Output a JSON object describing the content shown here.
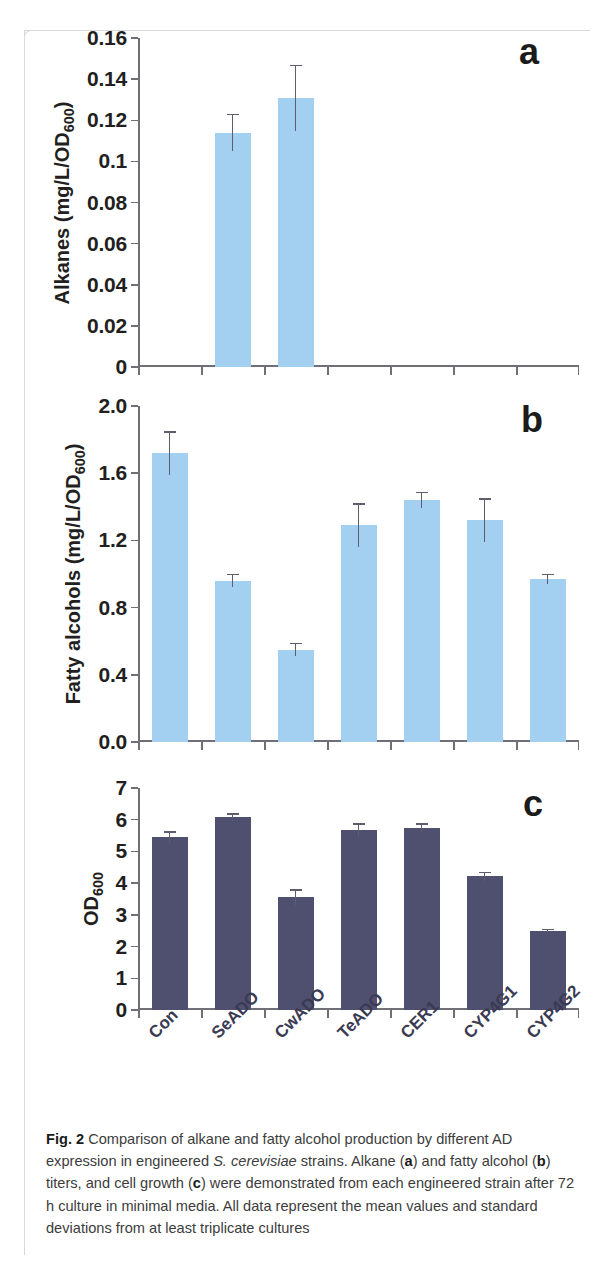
{
  "figure": {
    "label": "Fig. 2",
    "caption_parts": {
      "p1": "Comparison of alkane and fatty alcohol production by different AD expression in engineered ",
      "species": "S. cerevisiae",
      "p2": " strains. Alkane (",
      "a": "a",
      "p3": ") and fatty alcohol (",
      "b": "b",
      "p4": ") titers, and cell growth (",
      "c": "c",
      "p5": ") were demonstrated from each engineered strain after 72 h culture in minimal media. All data represent the mean values and standard deviations from at least triplicate cultures"
    }
  },
  "colors": {
    "light_bar": "#a3cff0",
    "dark_bar": "#4f4f70",
    "axis": "#6f6f77",
    "text": "#231f20",
    "category_label": "#3a3a52"
  },
  "categories": [
    "Con",
    "SeADO",
    "CwADO",
    "TeADO",
    "CER1",
    "CYP4G1",
    "CYP4G2"
  ],
  "chart_data": [
    {
      "type": "bar",
      "panel": "a",
      "title": "",
      "xlabel": "",
      "ylabel": "Alkanes (mg/L/OD600)",
      "ylabel_main": "Alkanes (mg/L/OD",
      "ylabel_sub": "600",
      "ylabel_tail": ")",
      "categories": [
        "Con",
        "SeADO",
        "CwADO",
        "TeADO",
        "CER1",
        "CYP4G1",
        "CYP4G2"
      ],
      "values": [
        0,
        0.114,
        0.131,
        0,
        0,
        0,
        0
      ],
      "errors": [
        0,
        0.009,
        0.016,
        0,
        0,
        0,
        0
      ],
      "ylim": [
        0,
        0.16
      ],
      "ytick_values": [
        0,
        0.02,
        0.04,
        0.06,
        0.08,
        0.1,
        0.12,
        0.14,
        0.16
      ],
      "ytick_labels": [
        "0",
        "0.02",
        "0.04",
        "0.06",
        "0.08",
        "0.1",
        "0.12",
        "0.14",
        "0.16"
      ],
      "grid": false,
      "legend": "none",
      "bar_color": "#a3cff0"
    },
    {
      "type": "bar",
      "panel": "b",
      "title": "",
      "xlabel": "",
      "ylabel": "Fatty alcohols (mg/L/OD600)",
      "ylabel_main": "Fatty alcohols (mg/L/OD",
      "ylabel_sub": "600",
      "ylabel_tail": ")",
      "categories": [
        "Con",
        "SeADO",
        "CwADO",
        "TeADO",
        "CER1",
        "CYP4G1",
        "CYP4G2"
      ],
      "values": [
        1.72,
        0.96,
        0.55,
        1.29,
        1.44,
        1.32,
        0.97
      ],
      "errors": [
        0.13,
        0.04,
        0.04,
        0.13,
        0.05,
        0.13,
        0.03
      ],
      "ylim": [
        0,
        2.0
      ],
      "ytick_values": [
        0.0,
        0.4,
        0.8,
        1.2,
        1.6,
        2.0
      ],
      "ytick_labels": [
        "0.0",
        "0.4",
        "0.8",
        "1.2",
        "1.6",
        "2.0"
      ],
      "grid": false,
      "legend": "none",
      "bar_color": "#a3cff0"
    },
    {
      "type": "bar",
      "panel": "c",
      "title": "",
      "xlabel": "",
      "ylabel": "OD600",
      "ylabel_main": "OD",
      "ylabel_sub": "600",
      "ylabel_tail": "",
      "categories": [
        "Con",
        "SeADO",
        "CwADO",
        "TeADO",
        "CER1",
        "CYP4G1",
        "CYP4G2"
      ],
      "values": [
        5.45,
        6.1,
        3.55,
        5.69,
        5.75,
        4.22,
        2.5
      ],
      "errors": [
        0.18,
        0.1,
        0.25,
        0.2,
        0.14,
        0.14,
        0.06
      ],
      "ylim": [
        0,
        7
      ],
      "ytick_values": [
        0,
        1,
        2,
        3,
        4,
        5,
        6,
        7
      ],
      "ytick_labels": [
        "0",
        "1",
        "2",
        "3",
        "4",
        "5",
        "6",
        "7"
      ],
      "grid": false,
      "legend": "none",
      "bar_color": "#4f4f70"
    }
  ],
  "panel_letters": {
    "a": "a",
    "b": "b",
    "c": "c"
  }
}
